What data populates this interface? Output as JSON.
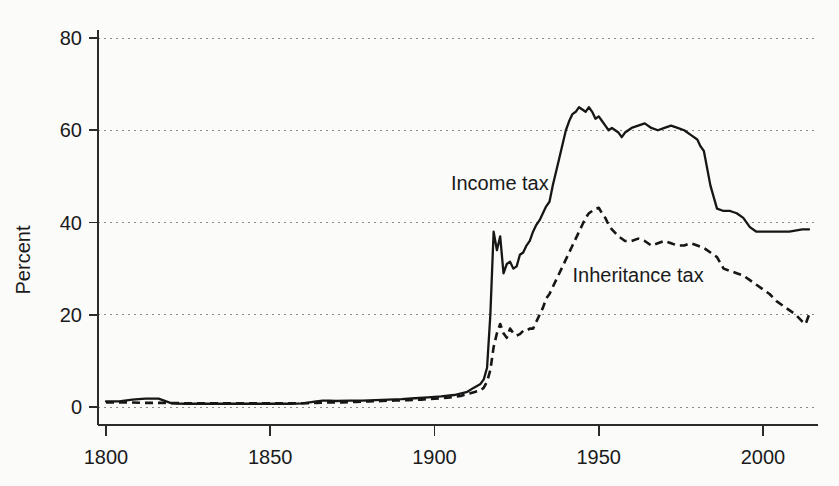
{
  "chart_data": {
    "type": "line",
    "title": "",
    "subtitle": "",
    "xlabel": "",
    "ylabel": "Percent",
    "xlim": [
      1800,
      2015
    ],
    "ylim": [
      0,
      85
    ],
    "grid": true,
    "grid_axis": "y",
    "legend": "inline-annotations",
    "y_ticks": [
      0,
      20,
      40,
      60,
      80
    ],
    "y_tick_labels": [
      "0",
      "20",
      "40",
      "60",
      "80"
    ],
    "x_ticks": [
      1800,
      1850,
      1900,
      1950,
      2000
    ],
    "x_tick_labels": [
      "1800",
      "1850",
      "1900",
      "1950",
      "2000"
    ],
    "annotations": [
      {
        "text": "Income tax",
        "x": 1905,
        "y": 47
      },
      {
        "text": "Inheritance tax",
        "x": 1942,
        "y": 27
      }
    ],
    "series": [
      {
        "name": "Income tax",
        "style": "solid",
        "x": [
          1800,
          1804,
          1808,
          1812,
          1816,
          1820,
          1824,
          1828,
          1832,
          1836,
          1840,
          1844,
          1848,
          1852,
          1856,
          1860,
          1864,
          1866,
          1868,
          1870,
          1874,
          1878,
          1882,
          1886,
          1890,
          1894,
          1898,
          1902,
          1906,
          1910,
          1912,
          1914,
          1915,
          1916,
          1917,
          1918,
          1919,
          1920,
          1921,
          1922,
          1923,
          1924,
          1925,
          1926,
          1927,
          1928,
          1929,
          1930,
          1931,
          1932,
          1933,
          1934,
          1935,
          1936,
          1937,
          1938,
          1939,
          1940,
          1941,
          1942,
          1943,
          1944,
          1945,
          1946,
          1947,
          1948,
          1949,
          1950,
          1951,
          1952,
          1953,
          1954,
          1955,
          1956,
          1957,
          1958,
          1960,
          1962,
          1964,
          1966,
          1968,
          1970,
          1972,
          1974,
          1976,
          1978,
          1980,
          1981,
          1982,
          1984,
          1986,
          1988,
          1990,
          1992,
          1994,
          1996,
          1998,
          2000,
          2004,
          2008,
          2012,
          2014
        ],
        "y": [
          1.2,
          1.2,
          1.6,
          1.8,
          1.8,
          0.8,
          0.7,
          0.7,
          0.7,
          0.7,
          0.7,
          0.7,
          0.7,
          0.7,
          0.7,
          0.8,
          1.2,
          1.4,
          1.4,
          1.3,
          1.4,
          1.4,
          1.5,
          1.6,
          1.7,
          1.9,
          2.1,
          2.3,
          2.6,
          3.3,
          4.2,
          5.0,
          6.0,
          8.5,
          20.0,
          38.0,
          34.0,
          37.0,
          29.0,
          31.0,
          31.5,
          30.0,
          30.5,
          33.0,
          33.5,
          35.0,
          36.0,
          38.0,
          39.5,
          40.5,
          42.0,
          43.5,
          44.5,
          48.0,
          51.0,
          54.0,
          57.0,
          60.0,
          62.0,
          63.5,
          64.0,
          65.0,
          64.5,
          64.0,
          65.0,
          64.0,
          62.5,
          63.0,
          62.0,
          61.0,
          60.0,
          60.5,
          60.0,
          59.5,
          58.5,
          59.5,
          60.5,
          61.0,
          61.5,
          60.5,
          60.0,
          60.5,
          61.0,
          60.5,
          60.0,
          59.0,
          58.0,
          56.5,
          55.5,
          48.0,
          43.0,
          42.5,
          42.5,
          42.0,
          41.0,
          39.0,
          38.0,
          38.0,
          38.0,
          38.0,
          38.5,
          38.5
        ]
      },
      {
        "name": "Inheritance tax",
        "style": "dashed",
        "x": [
          1800,
          1806,
          1812,
          1818,
          1824,
          1830,
          1836,
          1842,
          1848,
          1854,
          1860,
          1864,
          1868,
          1872,
          1876,
          1880,
          1884,
          1888,
          1892,
          1896,
          1900,
          1904,
          1908,
          1912,
          1914,
          1915,
          1916,
          1917,
          1918,
          1919,
          1920,
          1921,
          1922,
          1923,
          1924,
          1925,
          1926,
          1927,
          1928,
          1929,
          1930,
          1931,
          1932,
          1933,
          1934,
          1935,
          1936,
          1937,
          1938,
          1939,
          1940,
          1941,
          1942,
          1943,
          1944,
          1945,
          1946,
          1947,
          1948,
          1949,
          1950,
          1951,
          1952,
          1953,
          1954,
          1956,
          1958,
          1960,
          1962,
          1964,
          1966,
          1968,
          1970,
          1972,
          1974,
          1976,
          1978,
          1980,
          1982,
          1984,
          1986,
          1988,
          1990,
          1992,
          1994,
          1996,
          1998,
          2000,
          2002,
          2004,
          2006,
          2008,
          2010,
          2012,
          2013,
          2014
        ],
        "y": [
          1.0,
          1.0,
          0.9,
          0.9,
          0.8,
          0.8,
          0.8,
          0.8,
          0.8,
          0.8,
          0.8,
          0.9,
          1.0,
          1.0,
          1.1,
          1.2,
          1.3,
          1.4,
          1.5,
          1.6,
          1.8,
          2.0,
          2.4,
          3.2,
          3.6,
          4.2,
          5.5,
          8.0,
          13.0,
          16.0,
          18.0,
          16.0,
          15.0,
          17.0,
          16.0,
          15.5,
          15.8,
          16.5,
          16.5,
          17.0,
          17.0,
          18.5,
          20.0,
          21.5,
          23.5,
          24.5,
          26.0,
          27.5,
          29.0,
          30.5,
          32.0,
          33.5,
          35.0,
          36.5,
          38.0,
          39.5,
          41.0,
          42.0,
          42.5,
          43.0,
          43.2,
          42.0,
          41.0,
          39.5,
          38.5,
          37.0,
          36.0,
          36.0,
          36.5,
          36.0,
          35.0,
          35.5,
          36.0,
          35.5,
          35.0,
          35.0,
          35.5,
          35.0,
          34.5,
          33.5,
          32.5,
          30.0,
          29.5,
          29.0,
          28.5,
          27.5,
          26.5,
          25.5,
          24.5,
          23.0,
          22.0,
          21.0,
          20.0,
          18.5,
          18.0,
          20.0
        ]
      }
    ]
  }
}
